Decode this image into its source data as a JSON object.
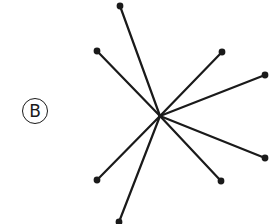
{
  "figure": {
    "label": "B",
    "colors": {
      "stroke": "#1a1a1a",
      "background": "#ffffff"
    },
    "graph": {
      "type": "star",
      "center": {
        "x": 160,
        "y": 116
      },
      "endpoints": [
        {
          "x": 120,
          "y": 6
        },
        {
          "x": 97,
          "y": 51
        },
        {
          "x": 222,
          "y": 52
        },
        {
          "x": 265,
          "y": 75
        },
        {
          "x": 265,
          "y": 158
        },
        {
          "x": 221,
          "y": 181
        },
        {
          "x": 97,
          "y": 180
        },
        {
          "x": 119,
          "y": 222
        }
      ]
    }
  }
}
